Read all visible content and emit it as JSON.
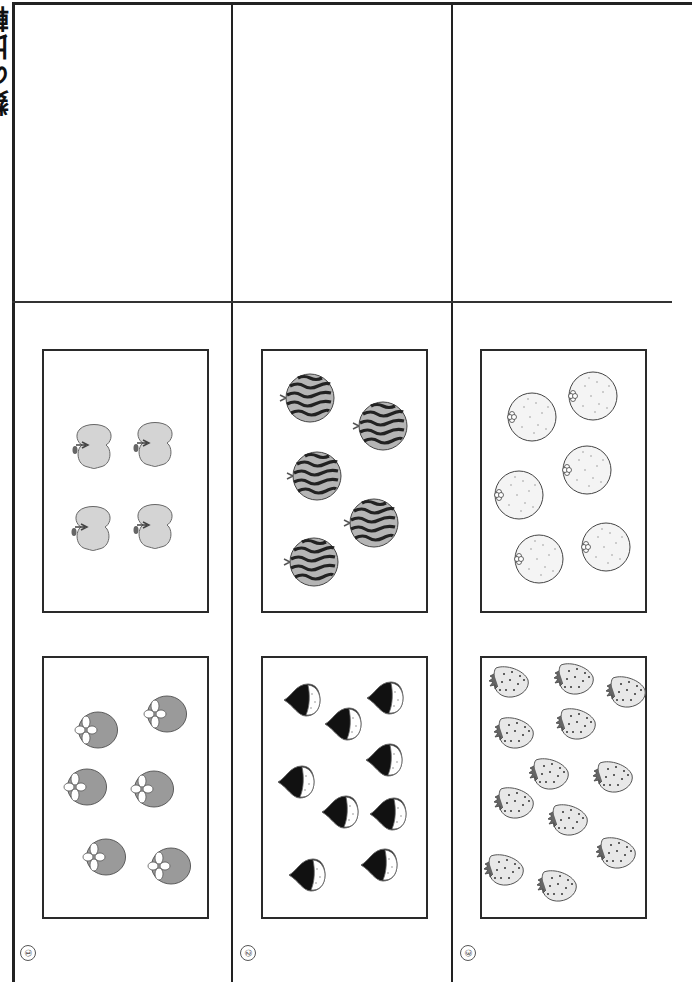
{
  "title": {
    "partial_text": "数の比較",
    "visible": "clipped, rotated 90°"
  },
  "questions": [
    {
      "number_label": "①",
      "upper_box": {
        "fruit": "apple",
        "count": 4,
        "icon": "apple-icon",
        "color": "#d4d4d4"
      },
      "lower_box": {
        "fruit": "persimmon",
        "count": 6,
        "icon": "persimmon-icon",
        "color": "#9a9a9a"
      }
    },
    {
      "number_label": "②",
      "upper_box": {
        "fruit": "watermelon",
        "count": 5,
        "icon": "watermelon-icon",
        "color": "#b5b5b5"
      },
      "lower_box": {
        "fruit": "chestnut",
        "count": 8,
        "icon": "chestnut-icon",
        "color": "#111111"
      }
    },
    {
      "number_label": "③",
      "upper_box": {
        "fruit": "orange",
        "count": 6,
        "icon": "orange-icon",
        "color": "#f2f2f2"
      },
      "lower_box": {
        "fruit": "strawberry",
        "count": 12,
        "icon": "strawberry-icon",
        "color": "#e6e6e6"
      }
    }
  ],
  "answer_cells": [
    "",
    "",
    ""
  ]
}
